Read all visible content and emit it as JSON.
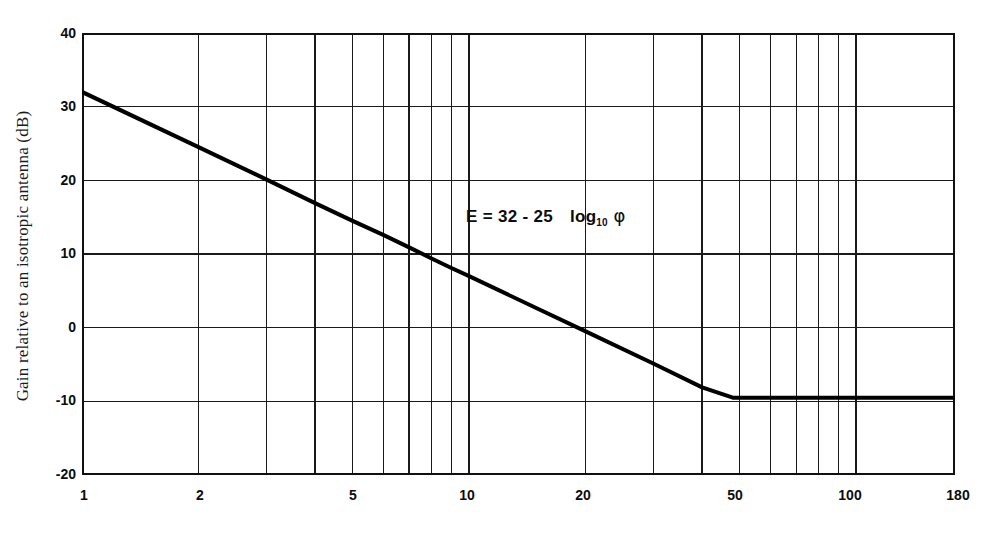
{
  "chart_data": {
    "type": "line",
    "title": "",
    "subtitle": "",
    "xlabel": "",
    "ylabel": "Gain relative to an isotropic antenna (dB)",
    "annotation": {
      "lhs": "E =",
      "expr": "32 - 25",
      "log_text": "log",
      "log_base": "10",
      "variable": "φ",
      "full": "E = 32 - 25  log10 φ"
    },
    "x_scale": "log",
    "y_scale": "linear",
    "xlim": [
      1,
      180
    ],
    "ylim": [
      -20,
      40
    ],
    "grid": true,
    "legend": "none",
    "x_tick_labels": [
      "1",
      "2",
      "5",
      "10",
      "20",
      "50",
      "100",
      "180"
    ],
    "x_tick_values": [
      1,
      2,
      5,
      10,
      20,
      50,
      100,
      180
    ],
    "x_gridline_values": [
      1,
      2,
      3,
      4,
      5,
      6,
      7,
      8,
      9,
      10,
      20,
      30,
      40,
      50,
      60,
      70,
      80,
      90,
      100,
      180
    ],
    "y_tick_labels": [
      "40",
      "30",
      "20",
      "10",
      "0",
      "-10",
      "-20"
    ],
    "y_tick_values": [
      40,
      30,
      20,
      10,
      0,
      -10,
      -20
    ],
    "series": [
      {
        "name": "E = 32 - 25 log10 phi",
        "color": "#000000",
        "line_width": 4,
        "points": [
          {
            "x": 1,
            "y": 32.0
          },
          {
            "x": 2,
            "y": 24.5
          },
          {
            "x": 3,
            "y": 20.1
          },
          {
            "x": 4,
            "y": 16.9
          },
          {
            "x": 5,
            "y": 14.5
          },
          {
            "x": 6,
            "y": 12.6
          },
          {
            "x": 7,
            "y": 10.9
          },
          {
            "x": 8,
            "y": 9.4
          },
          {
            "x": 9,
            "y": 8.1
          },
          {
            "x": 10,
            "y": 7.0
          },
          {
            "x": 15,
            "y": 2.6
          },
          {
            "x": 20,
            "y": -0.5
          },
          {
            "x": 30,
            "y": -4.9
          },
          {
            "x": 40,
            "y": -8.1
          },
          {
            "x": 48,
            "y": -9.5
          },
          {
            "x": 50,
            "y": -9.5
          },
          {
            "x": 70,
            "y": -9.5
          },
          {
            "x": 100,
            "y": -9.5
          },
          {
            "x": 140,
            "y": -9.5
          },
          {
            "x": 180,
            "y": -9.5
          }
        ]
      }
    ],
    "floor_value": -9.5,
    "floor_start_x": 48,
    "start_value": 32.0,
    "slope_coefficient": -25,
    "intercept": 32
  },
  "axes": {
    "y_ticks": [
      {
        "label": "40",
        "value": 40
      },
      {
        "label": "30",
        "value": 30
      },
      {
        "label": "20",
        "value": 20
      },
      {
        "label": "10",
        "value": 10
      },
      {
        "label": "0",
        "value": 0
      },
      {
        "label": "-10",
        "value": -10
      },
      {
        "label": "-20",
        "value": -20
      }
    ],
    "x_ticks": [
      {
        "label": "1",
        "value": 1
      },
      {
        "label": "2",
        "value": 2
      },
      {
        "label": "5",
        "value": 5
      },
      {
        "label": "10",
        "value": 10
      },
      {
        "label": "20",
        "value": 20
      },
      {
        "label": "50",
        "value": 50
      },
      {
        "label": "100",
        "value": 100
      },
      {
        "label": "180",
        "value": 180
      }
    ]
  },
  "colors": {
    "background": "#ffffff",
    "axis": "#111111",
    "grid": "#1a1a1a",
    "curve": "#000000",
    "text": "#0c0c0c"
  }
}
